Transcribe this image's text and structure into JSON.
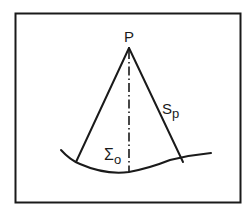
{
  "diagram": {
    "type": "geometric-schematic",
    "labels": {
      "apex": "P",
      "slant": "S",
      "slant_subscript": "p",
      "surface": "Σ",
      "surface_subscript": "o"
    },
    "colors": {
      "ink": "#1a1a1a",
      "background": "#ffffff"
    },
    "elements": [
      {
        "id": "frame",
        "kind": "rectangle"
      },
      {
        "id": "apex-point",
        "kind": "point",
        "label": "P"
      },
      {
        "id": "left-line",
        "kind": "line",
        "from": "P",
        "to": "surface-left-intersection"
      },
      {
        "id": "right-line",
        "kind": "line",
        "from": "P",
        "to": "surface-right-intersection",
        "label": "Sp"
      },
      {
        "id": "axis-line",
        "kind": "dash-dot-line",
        "from": "P",
        "to": "surface-bottom"
      },
      {
        "id": "surface-curve",
        "kind": "curve",
        "label": "Σo"
      }
    ]
  }
}
